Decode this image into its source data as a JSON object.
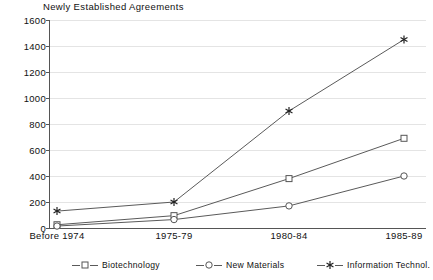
{
  "chart_data": {
    "type": "line",
    "title": "Newly Established Agreements",
    "xlabel": "",
    "ylabel": "",
    "ylim": [
      0,
      1600
    ],
    "yticks": [
      0,
      200,
      400,
      600,
      800,
      1000,
      1200,
      1400,
      1600
    ],
    "ytick_labels": [
      "0",
      "200",
      "400",
      "600",
      "800",
      "1000",
      "1200",
      "1400",
      "1600"
    ],
    "grid": "horizontal",
    "legend_position": "bottom",
    "categories": [
      "Before 1974",
      "1975-79",
      "1980-84",
      "1985-89"
    ],
    "series": [
      {
        "name": "Biotechnology",
        "marker": "square",
        "color": "#555555",
        "values": [
          25,
          95,
          380,
          690
        ]
      },
      {
        "name": "New Materials",
        "marker": "circle",
        "color": "#555555",
        "values": [
          15,
          65,
          170,
          400
        ]
      },
      {
        "name": "Information Technol.",
        "marker": "asterisk",
        "color": "#222222",
        "values": [
          130,
          200,
          900,
          1450
        ]
      }
    ]
  },
  "legend": {
    "entries": [
      {
        "label": "Biotechnology",
        "marker": "square"
      },
      {
        "label": "New Materials",
        "marker": "circle"
      },
      {
        "label": "Information Technol.",
        "marker": "asterisk"
      }
    ]
  },
  "colors": {
    "background": "#ffffff",
    "axis": "#555555",
    "gridline": "#e4e4e4",
    "text": "#111111",
    "line": "#5a5a5a"
  }
}
